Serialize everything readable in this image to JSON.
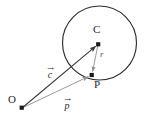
{
  "figure": {
    "background_color": "#ffffff",
    "width": 150,
    "height": 124,
    "colors": {
      "circle_stroke": "#2b2b2b",
      "vector_c_stroke": "#3a3a3a",
      "vector_p_stroke": "#8c8c8c",
      "vector_r_stroke": "#8c8c8c",
      "point_fill": "#1a1a1a",
      "label_text": "#2b2b2b"
    },
    "circle": {
      "name": "circle",
      "center_x": 99.5,
      "center_y": 43,
      "radius": 37
    },
    "points": [
      {
        "id": "O",
        "label": "O",
        "x": 22,
        "y": 108,
        "label_x": 8,
        "label_y": 94
      },
      {
        "id": "C",
        "label": "C",
        "x": 98,
        "y": 44,
        "label_x": 93,
        "label_y": 24
      },
      {
        "id": "P",
        "label": "P",
        "x": 91.5,
        "y": 75,
        "label_x": 94,
        "label_y": 79
      }
    ],
    "vectors": [
      {
        "id": "c",
        "label": "c",
        "arrow_glyph": "→",
        "from": "O",
        "to": "C",
        "x1": 22,
        "y1": 108,
        "x2": 98,
        "y2": 44,
        "label_x": 46,
        "label_y": 65,
        "color": "#3a3a3a"
      },
      {
        "id": "p",
        "label": "p",
        "arrow_glyph": "→",
        "from": "O",
        "to": "P",
        "x1": 22,
        "y1": 108,
        "x2": 91.5,
        "y2": 75,
        "label_x": 63,
        "label_y": 96,
        "color": "#8c8c8c"
      },
      {
        "id": "r",
        "label": "r",
        "arrow_glyph": "",
        "from": "C",
        "to": "P",
        "x1": 98,
        "y1": 44,
        "x2": 91.5,
        "y2": 75,
        "label_x": 100,
        "label_y": 50,
        "color": "#8c8c8c"
      }
    ]
  }
}
